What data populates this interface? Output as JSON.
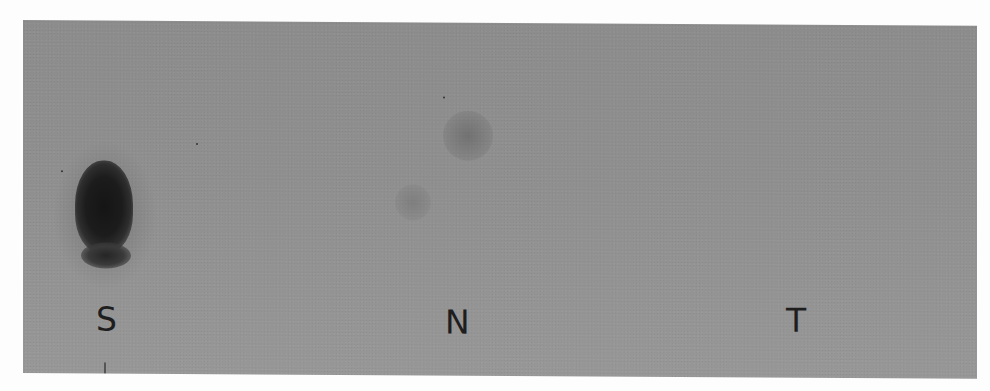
{
  "figure": {
    "background_color": "#8f8f8f",
    "lanes": [
      {
        "label": "S",
        "signal": "strong dark spot"
      },
      {
        "label": "N",
        "signal": "faint smudge"
      },
      {
        "label": "T",
        "signal": "none visible"
      }
    ]
  }
}
